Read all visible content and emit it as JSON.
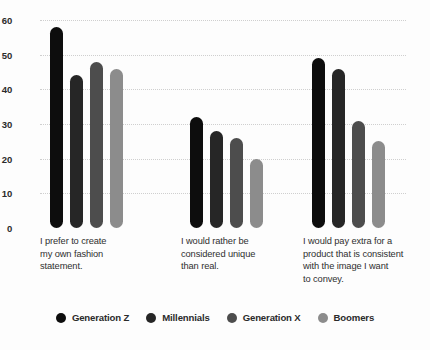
{
  "chart_data": {
    "type": "bar",
    "title": "",
    "subtitle": "",
    "xlabel": "",
    "ylabel": "",
    "ylim": [
      0,
      60
    ],
    "yticks": [
      0,
      10,
      20,
      30,
      40,
      50,
      60
    ],
    "ytick_labels": [
      "0",
      "10",
      "20",
      "30",
      "40",
      "50",
      "60"
    ],
    "grid": "horizontal-dotted",
    "legend_position": "bottom-center",
    "categories": [
      "I prefer to create my own fashion statement.",
      "I would rather be considered unique than real.",
      "I would pay extra for a product that is consistent with the image I want to convey."
    ],
    "series": [
      {
        "name": "Generation Z",
        "color": "#0d0d0d",
        "values": [
          58,
          32,
          49
        ]
      },
      {
        "name": "Millennials",
        "color": "#262626",
        "values": [
          44,
          28,
          46
        ]
      },
      {
        "name": "Generation X",
        "color": "#4d4d4d",
        "values": [
          48,
          26,
          31
        ]
      },
      {
        "name": "Boomers",
        "color": "#8c8c8c",
        "values": [
          46,
          20,
          25
        ]
      }
    ]
  },
  "axis": {
    "tick_0": "0",
    "tick_1": "10",
    "tick_2": "20",
    "tick_3": "30",
    "tick_4": "40",
    "tick_5": "50",
    "tick_6": "60"
  },
  "captions": {
    "group_1_line_1": "I prefer to create",
    "group_1_line_2": "my own fashion",
    "group_1_line_3": "statement.",
    "group_2_line_1": "I would rather be",
    "group_2_line_2": "considered unique",
    "group_2_line_3": "than real.",
    "group_3_line_1": "I would pay extra for a",
    "group_3_line_2": "product that is consistent",
    "group_3_line_3": "with the image I want",
    "group_3_line_4": "to convey."
  },
  "legend": {
    "items": [
      {
        "label": "Generation Z",
        "color": "#0d0d0d"
      },
      {
        "label": "Millennials",
        "color": "#262626"
      },
      {
        "label": "Generation X",
        "color": "#4d4d4d"
      },
      {
        "label": "Boomers",
        "color": "#8c8c8c"
      }
    ]
  },
  "colors": {
    "background": "#fdfdfd",
    "gridline": "#cfcfcf",
    "axis_text": "#2b2b2b",
    "caption_text": "#2f2f2f"
  }
}
